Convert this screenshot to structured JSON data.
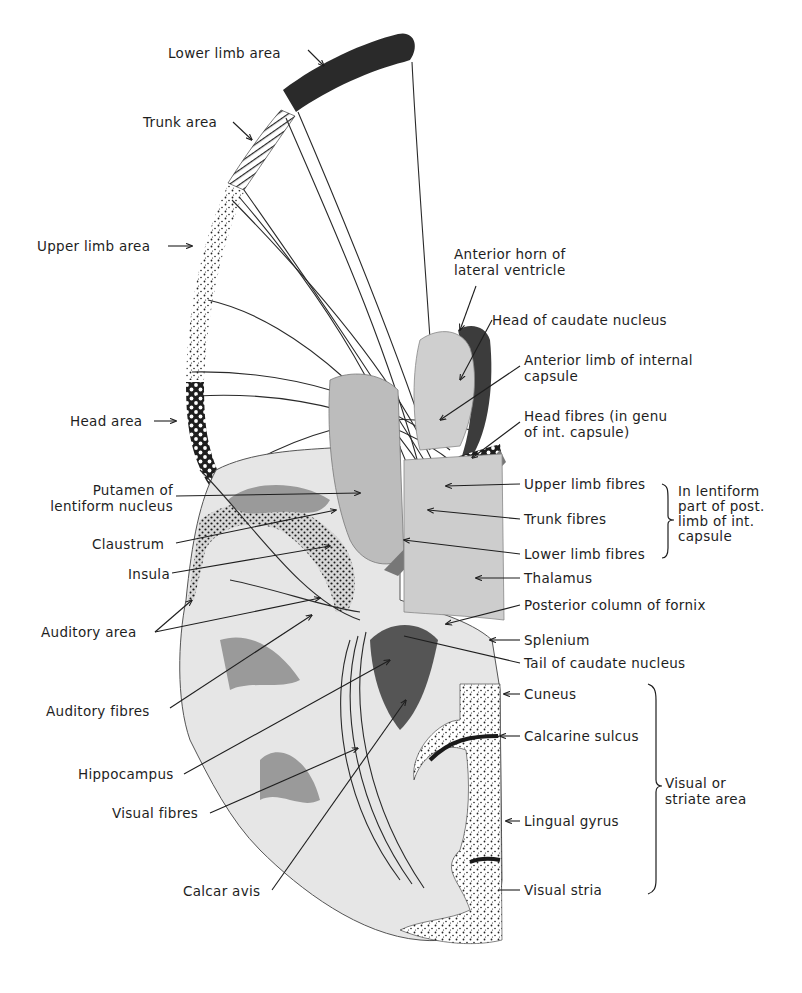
{
  "figure": {
    "colors": {
      "background": "#ffffff",
      "ink": "#1e1e1e",
      "lower_limb_band": "#2a2a2a",
      "grey_matter": "#8c8c8c",
      "white_matter": "#e4e4e4",
      "thalamus": "#c9c9c9",
      "ventricle": "#4a4a4a"
    }
  },
  "cortical_areas": [
    {
      "id": "lower-limb-area",
      "label": "Lower limb area",
      "x": 168,
      "y": 45,
      "pattern": "solid-dark"
    },
    {
      "id": "trunk-area",
      "label": "Trunk area",
      "x": 143,
      "y": 114,
      "pattern": "hatched"
    },
    {
      "id": "upper-limb-area",
      "label": "Upper limb area",
      "x": 37,
      "y": 238,
      "pattern": "stippled"
    },
    {
      "id": "head-area",
      "label": "Head area",
      "x": 70,
      "y": 413,
      "pattern": "checkered"
    }
  ],
  "left_labels": [
    {
      "id": "putamen",
      "label": "Putamen of\nlentiform nucleus",
      "x": 37,
      "y": 482
    },
    {
      "id": "claustrum",
      "label": "Claustrum",
      "x": 92,
      "y": 536
    },
    {
      "id": "insula",
      "label": "Insula",
      "x": 128,
      "y": 566
    },
    {
      "id": "auditory-area",
      "label": "Auditory area",
      "x": 41,
      "y": 624
    },
    {
      "id": "auditory-fibres",
      "label": "Auditory fibres",
      "x": 46,
      "y": 703
    },
    {
      "id": "hippocampus",
      "label": "Hippocampus",
      "x": 78,
      "y": 766
    },
    {
      "id": "visual-fibres",
      "label": "Visual fibres",
      "x": 112,
      "y": 805
    },
    {
      "id": "calcar-avis",
      "label": "Calcar avis",
      "x": 183,
      "y": 883
    }
  ],
  "right_labels": [
    {
      "id": "anterior-horn",
      "label": "Anterior horn of\nlateral ventricle",
      "x": 454,
      "y": 246
    },
    {
      "id": "head-caudate",
      "label": "Head of caudate nucleus",
      "x": 492,
      "y": 312
    },
    {
      "id": "anterior-limb",
      "label": "Anterior limb of internal\ncapsule",
      "x": 524,
      "y": 352
    },
    {
      "id": "head-fibres",
      "label": "Head fibres (in genu\nof int. capsule)",
      "x": 524,
      "y": 408
    },
    {
      "id": "upper-limb-fibres",
      "label": "Upper limb fibres",
      "x": 524,
      "y": 476
    },
    {
      "id": "trunk-fibres",
      "label": "Trunk fibres",
      "x": 524,
      "y": 511
    },
    {
      "id": "lower-limb-fibres",
      "label": "Lower limb fibres",
      "x": 524,
      "y": 546
    },
    {
      "id": "thalamus",
      "label": "Thalamus",
      "x": 524,
      "y": 570
    },
    {
      "id": "posterior-column-fornix",
      "label": "Posterior column of fornix",
      "x": 524,
      "y": 597
    },
    {
      "id": "splenium",
      "label": "Splenium",
      "x": 524,
      "y": 632
    },
    {
      "id": "tail-caudate",
      "label": "Tail of caudate nucleus",
      "x": 524,
      "y": 655
    },
    {
      "id": "cuneus",
      "label": "Cuneus",
      "x": 524,
      "y": 686
    },
    {
      "id": "calcarine-sulcus",
      "label": "Calcarine sulcus",
      "x": 524,
      "y": 728
    },
    {
      "id": "lingual-gyrus",
      "label": "Lingual gyrus",
      "x": 524,
      "y": 813
    },
    {
      "id": "visual-stria",
      "label": "Visual stria",
      "x": 524,
      "y": 882
    }
  ],
  "brackets": [
    {
      "id": "lentiform-bracket",
      "label": "In lentiform\npart of post.\nlimb of int.\ncapsule",
      "x": 678,
      "y": 484
    },
    {
      "id": "visual-bracket",
      "label": "Visual or\nstriate area",
      "x": 665,
      "y": 775
    }
  ]
}
